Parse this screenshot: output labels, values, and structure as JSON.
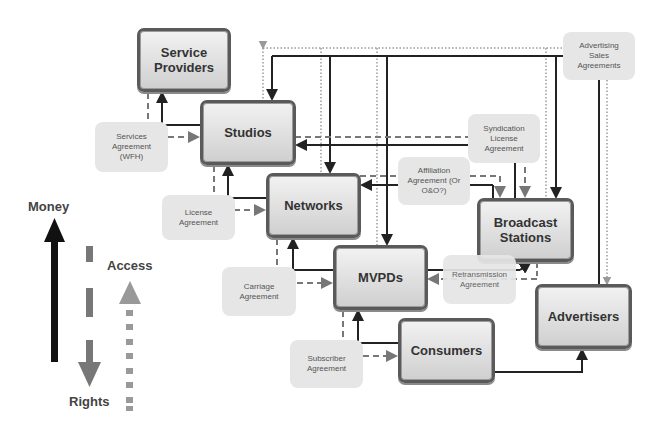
{
  "nodes": {
    "service_providers": "Service Providers",
    "studios": "Studios",
    "networks": "Networks",
    "mvpds": "MVPDs",
    "broadcast_stations": "Broadcast Stations",
    "advertisers": "Advertisers",
    "consumers": "Consumers"
  },
  "agreements": {
    "services": "Services Agreement (WFH)",
    "license": "License Agreement",
    "carriage": "Carriage Agreement",
    "subscriber": "Subscriber Agreement",
    "affiliation": "Affiliation Agreement (Or O&O?)",
    "syndication": "Syndication License Agreement",
    "retransmission": "Retransmission Agreement",
    "advertising_sales": "Advertising Sales Agreements"
  },
  "legend": {
    "money": "Money",
    "rights": "Rights",
    "access": "Access",
    "colors": {
      "money": "#111111",
      "rights": "#777777",
      "access": "#999999"
    }
  }
}
